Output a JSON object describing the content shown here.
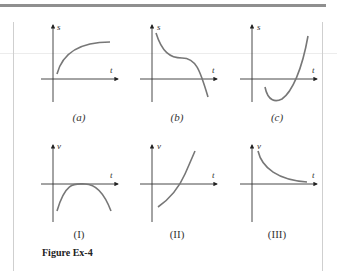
{
  "figure": {
    "caption": "Figure Ex-4",
    "panels_top": [
      {
        "label": "(a)",
        "y_axis": "s",
        "x_axis": "t",
        "shape": "increasing concave-down approaching asymptote"
      },
      {
        "label": "(b)",
        "y_axis": "s",
        "x_axis": "t",
        "shape": "decreasing with inflection plateau then crossing below axis"
      },
      {
        "label": "(c)",
        "y_axis": "s",
        "x_axis": "t",
        "shape": "starts below axis, dips to minimum, then rises steeply"
      }
    ],
    "panels_bottom": [
      {
        "label": "(I)",
        "y_axis": "v",
        "x_axis": "t",
        "shape": "downward parabola touching axis at vertex"
      },
      {
        "label": "(II)",
        "y_axis": "v",
        "x_axis": "t",
        "shape": "increasing concave-up crossing axis"
      },
      {
        "label": "(III)",
        "y_axis": "v",
        "x_axis": "t",
        "shape": "positive decreasing approaching zero"
      }
    ]
  },
  "labels": {
    "a": "(a)",
    "b": "(b)",
    "c": "(c)",
    "I": "(I)",
    "II": "(II)",
    "III": "(III)",
    "s": "s",
    "v": "v",
    "t": "t"
  }
}
